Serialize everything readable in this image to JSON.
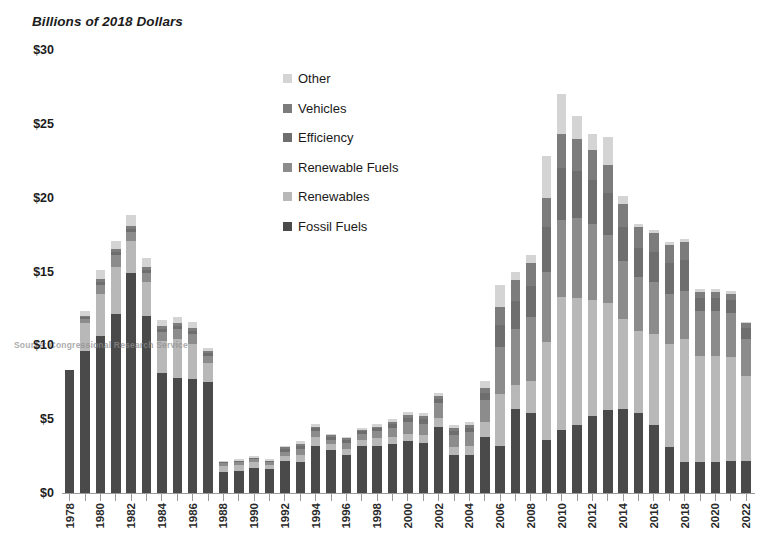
{
  "chart_data": {
    "type": "bar",
    "stacked": true,
    "title": "Billions of 2018 Dollars",
    "xlabel": "",
    "ylabel": "Billions of 2018 Dollars",
    "ylim": [
      0,
      30
    ],
    "yticks": [
      0,
      5,
      10,
      15,
      20,
      25,
      30
    ],
    "ytick_labels": [
      "$0",
      "$5",
      "$10",
      "$15",
      "$20",
      "$25",
      "$30"
    ],
    "grid": false,
    "legend_position": "inside-upper-center",
    "source_note": "Source: Congressional Research Service",
    "categories": [
      "1978",
      "1979",
      "1980",
      "1981",
      "1982",
      "1983",
      "1984",
      "1985",
      "1986",
      "1987",
      "1988",
      "1989",
      "1990",
      "1991",
      "1992",
      "1993",
      "1994",
      "1995",
      "1996",
      "1997",
      "1998",
      "1999",
      "2000",
      "2001",
      "2002",
      "2003",
      "2004",
      "2005",
      "2006",
      "2007",
      "2008",
      "2009",
      "2010",
      "2011",
      "2012",
      "2013",
      "2014",
      "2015",
      "2016",
      "2017",
      "2018",
      "2019",
      "2020",
      "2021",
      "2022"
    ],
    "xtick_labels": [
      "1978",
      "",
      "1980",
      "",
      "1982",
      "",
      "1984",
      "",
      "1986",
      "",
      "1988",
      "",
      "1990",
      "",
      "1992",
      "",
      "1994",
      "",
      "1996",
      "",
      "1998",
      "",
      "2000",
      "",
      "2002",
      "",
      "2004",
      "",
      "2006",
      "",
      "2008",
      "",
      "2010",
      "",
      "2012",
      "",
      "2014",
      "",
      "2016",
      "",
      "2018",
      "",
      "2020",
      "",
      "2022"
    ],
    "series": [
      {
        "name": "Fossil Fuels",
        "color": "#4a4a4a",
        "values": [
          8.3,
          9.6,
          10.6,
          12.1,
          14.9,
          12.0,
          8.1,
          7.8,
          7.7,
          7.5,
          1.4,
          1.5,
          1.7,
          1.6,
          2.2,
          2.1,
          3.2,
          2.9,
          2.6,
          3.2,
          3.2,
          3.3,
          3.5,
          3.4,
          4.5,
          2.6,
          2.6,
          3.8,
          3.2,
          5.7,
          5.4,
          3.6,
          4.3,
          4.6,
          5.2,
          5.6,
          5.7,
          5.4,
          4.6,
          3.1,
          2.1,
          2.1,
          2.1,
          2.2,
          2.2
        ]
      },
      {
        "name": "Renewables",
        "color": "#b8b8b8",
        "values": [
          0.0,
          1.9,
          2.9,
          3.2,
          2.2,
          2.3,
          2.2,
          2.6,
          2.4,
          1.3,
          0.4,
          0.4,
          0.4,
          0.3,
          0.3,
          0.5,
          0.6,
          0.4,
          0.4,
          0.4,
          0.5,
          0.5,
          0.5,
          0.5,
          0.6,
          0.5,
          0.6,
          1.0,
          3.5,
          1.6,
          2.2,
          6.6,
          9.0,
          8.6,
          7.9,
          7.3,
          6.1,
          5.6,
          6.2,
          7.0,
          8.3,
          7.2,
          7.2,
          7.0,
          5.7
        ]
      },
      {
        "name": "Renewable Fuels",
        "color": "#8c8c8c",
        "values": [
          0.0,
          0.3,
          0.6,
          0.8,
          0.6,
          0.6,
          0.6,
          0.7,
          0.7,
          0.5,
          0.2,
          0.2,
          0.2,
          0.2,
          0.3,
          0.4,
          0.4,
          0.3,
          0.4,
          0.4,
          0.5,
          0.6,
          0.8,
          0.8,
          1.0,
          0.8,
          0.9,
          1.5,
          3.2,
          3.8,
          4.3,
          4.8,
          5.2,
          5.4,
          5.1,
          4.6,
          3.9,
          3.6,
          3.5,
          3.4,
          3.3,
          3.0,
          3.0,
          3.0,
          2.5
        ]
      },
      {
        "name": "Efficiency",
        "color": "#6e6e6e",
        "values": [
          0.0,
          0.1,
          0.2,
          0.2,
          0.2,
          0.2,
          0.2,
          0.2,
          0.2,
          0.2,
          0.1,
          0.1,
          0.1,
          0.1,
          0.2,
          0.2,
          0.2,
          0.2,
          0.2,
          0.2,
          0.2,
          0.3,
          0.3,
          0.3,
          0.3,
          0.3,
          0.3,
          0.5,
          1.5,
          1.9,
          2.1,
          3.0,
          3.5,
          3.2,
          3.0,
          2.8,
          2.3,
          2.0,
          2.0,
          2.1,
          2.1,
          0.9,
          0.9,
          0.9,
          0.8
        ]
      },
      {
        "name": "Vehicles",
        "color": "#7c7c7c",
        "values": [
          0.0,
          0.1,
          0.2,
          0.2,
          0.2,
          0.2,
          0.2,
          0.2,
          0.2,
          0.1,
          0.0,
          0.0,
          0.0,
          0.0,
          0.1,
          0.1,
          0.1,
          0.1,
          0.1,
          0.1,
          0.1,
          0.1,
          0.2,
          0.2,
          0.2,
          0.2,
          0.2,
          0.3,
          1.2,
          1.4,
          1.6,
          2.0,
          2.3,
          2.2,
          2.0,
          1.9,
          1.6,
          1.4,
          1.3,
          1.2,
          1.2,
          0.4,
          0.4,
          0.4,
          0.3
        ]
      },
      {
        "name": "Other",
        "color": "#d4d4d4",
        "values": [
          0.0,
          0.3,
          0.6,
          0.6,
          0.7,
          0.6,
          0.4,
          0.4,
          0.4,
          0.2,
          0.1,
          0.1,
          0.1,
          0.1,
          0.1,
          0.2,
          0.2,
          0.1,
          0.1,
          0.1,
          0.2,
          0.2,
          0.2,
          0.2,
          0.2,
          0.2,
          0.2,
          0.5,
          1.5,
          0.6,
          0.5,
          2.8,
          2.7,
          1.5,
          1.1,
          1.9,
          0.5,
          0.2,
          0.2,
          0.2,
          0.2,
          0.2,
          0.2,
          0.2,
          0.1
        ]
      }
    ],
    "totals": [
      8.3,
      12.3,
      15.1,
      17.1,
      18.8,
      15.9,
      11.7,
      11.9,
      11.6,
      9.8,
      2.2,
      2.3,
      2.5,
      2.3,
      3.2,
      3.5,
      4.7,
      4.0,
      3.8,
      4.4,
      4.7,
      5.0,
      5.5,
      5.4,
      6.8,
      4.6,
      4.8,
      7.6,
      14.1,
      15.0,
      16.1,
      22.8,
      27.0,
      25.5,
      24.3,
      24.1,
      20.1,
      18.2,
      17.8,
      17.0,
      17.2,
      13.8,
      13.8,
      13.7,
      11.6
    ]
  },
  "legend": {
    "items": [
      {
        "label": "Other",
        "color": "#d4d4d4"
      },
      {
        "label": "Vehicles",
        "color": "#7c7c7c"
      },
      {
        "label": "Efficiency",
        "color": "#6e6e6e"
      },
      {
        "label": "Renewable Fuels",
        "color": "#8c8c8c"
      },
      {
        "label": "Renewables",
        "color": "#b8b8b8"
      },
      {
        "label": "Fossil Fuels",
        "color": "#4a4a4a"
      }
    ]
  }
}
